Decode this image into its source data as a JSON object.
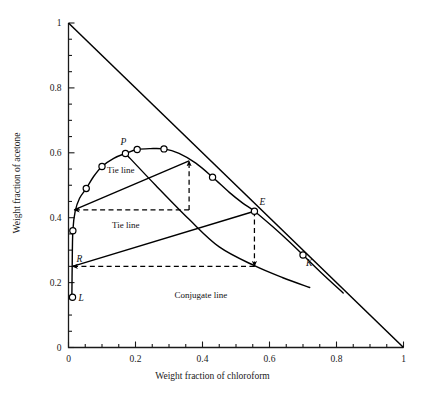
{
  "figure": {
    "caption": ""
  },
  "axes": {
    "x": {
      "title": "Weight fraction of chloroform",
      "min": 0,
      "max": 1,
      "ticks": [
        "0",
        "0.2",
        "0.4",
        "0.6",
        "0.8",
        "1"
      ],
      "tick_values": [
        0,
        0.2,
        0.4,
        0.6,
        0.8,
        1
      ],
      "minor_step": 0.05
    },
    "y": {
      "title": "Weight fraction of acetone",
      "min": 0,
      "max": 1,
      "ticks": [
        "0",
        "0.2",
        "0.4",
        "0.6",
        "0.8",
        "1"
      ],
      "tick_values": [
        0,
        0.2,
        0.4,
        0.6,
        0.8,
        1
      ],
      "minor_step": 0.05
    }
  },
  "annotations": {
    "tieline_upper": "Tie line",
    "tieline_lower": "Tie line",
    "conjugate": "Conjugate line",
    "point_P": "P",
    "point_E": "E",
    "point_K": "K",
    "point_R": "R",
    "point_L": "L"
  },
  "colors": {
    "curve": "#000000",
    "axis": "#1a1a1a",
    "marker_fill": "#ffffff",
    "dashed": "#000000"
  },
  "chart_data": {
    "type": "scatter",
    "title": "",
    "xlabel": "Weight fraction of chloroform",
    "ylabel": "Weight fraction of acetone",
    "xlim": [
      0,
      1
    ],
    "ylim": [
      0,
      1
    ],
    "grid": false,
    "legend": "none",
    "series": [
      {
        "name": "Binodal (solubility) curve — measured points",
        "type": "scatter",
        "x": [
          0.012,
          0.013,
          0.053,
          0.1,
          0.17,
          0.205,
          0.285,
          0.43,
          0.555,
          0.7
        ],
        "y": [
          0.155,
          0.36,
          0.49,
          0.558,
          0.598,
          0.61,
          0.612,
          0.525,
          0.42,
          0.285
        ]
      },
      {
        "name": "Binodal curve (smooth)",
        "type": "line",
        "x": [
          0.01,
          0.011,
          0.013,
          0.02,
          0.033,
          0.053,
          0.075,
          0.1,
          0.135,
          0.17,
          0.205,
          0.245,
          0.285,
          0.33,
          0.38,
          0.43,
          0.48,
          0.52,
          0.555,
          0.61,
          0.66,
          0.7,
          0.76,
          0.82
        ],
        "y": [
          0.15,
          0.25,
          0.36,
          0.42,
          0.46,
          0.49,
          0.527,
          0.558,
          0.583,
          0.598,
          0.61,
          0.613,
          0.612,
          0.598,
          0.568,
          0.525,
          0.478,
          0.445,
          0.42,
          0.372,
          0.325,
          0.285,
          0.225,
          0.168
        ]
      },
      {
        "name": "Hypotenuse (acetone + chloroform = 1)",
        "type": "line",
        "x": [
          0,
          1
        ],
        "y": [
          1,
          0
        ]
      },
      {
        "name": "Upper tie line",
        "type": "line",
        "x": [
          0.017,
          0.36
        ],
        "y": [
          0.424,
          0.575
        ]
      },
      {
        "name": "Lower tie line",
        "type": "line",
        "x": [
          0.012,
          0.555
        ],
        "y": [
          0.25,
          0.42
        ]
      },
      {
        "name": "Conjugate line",
        "type": "line",
        "x": [
          0.17,
          0.26,
          0.36,
          0.45,
          0.555,
          0.64,
          0.72
        ],
        "y": [
          0.598,
          0.5,
          0.395,
          0.31,
          0.252,
          0.215,
          0.185
        ]
      },
      {
        "name": "Projection: upper tie line raffinate",
        "type": "dashed",
        "x": [
          0.36,
          0.017
        ],
        "y": [
          0.424,
          0.424
        ]
      },
      {
        "name": "Projection: upper tie line extract",
        "type": "dashed",
        "x": [
          0.36,
          0.36
        ],
        "y": [
          0.424,
          0.575
        ]
      },
      {
        "name": "Projection: lower tie line raffinate",
        "type": "dashed",
        "x": [
          0.555,
          0.012
        ],
        "y": [
          0.25,
          0.25
        ]
      },
      {
        "name": "Projection: lower tie line extract",
        "type": "dashed",
        "x": [
          0.555,
          0.555
        ],
        "y": [
          0.42,
          0.25
        ]
      }
    ],
    "labeled_points": [
      {
        "label": "P",
        "x": 0.17,
        "y": 0.598,
        "note": "plait point region"
      },
      {
        "label": "E",
        "x": 0.555,
        "y": 0.42,
        "note": "extract phase"
      },
      {
        "label": "K",
        "x": 0.7,
        "y": 0.285,
        "note": "conjugate point"
      },
      {
        "label": "R",
        "x": 0.012,
        "y": 0.25,
        "note": "raffinate phase"
      },
      {
        "label": "L",
        "x": 0.012,
        "y": 0.155,
        "note": "lower point"
      }
    ]
  }
}
